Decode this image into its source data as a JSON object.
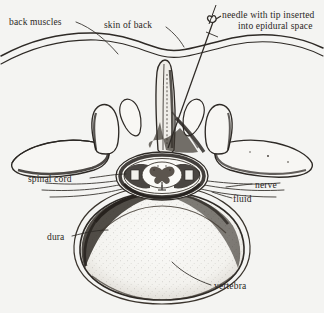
{
  "figure": {
    "type": "anatomical-line-drawing",
    "background_color": "#f4f4f2",
    "ink_color": "#2a2724",
    "labels": [
      {
        "id": "back-muscles",
        "text": "back muscles"
      },
      {
        "id": "skin-of-back",
        "text": "skin of back"
      },
      {
        "id": "needle-line1",
        "text": "needle with tip inserted"
      },
      {
        "id": "needle-line2",
        "text": "into epidural space"
      },
      {
        "id": "spinal-cord",
        "text": "spinal cord"
      },
      {
        "id": "dura",
        "text": "dura"
      },
      {
        "id": "nerve",
        "text": "nerve"
      },
      {
        "id": "fluid",
        "text": "fluid"
      },
      {
        "id": "vertebra",
        "text": "vertebra"
      }
    ],
    "structures": [
      "skin-of-back",
      "back-muscles",
      "spinous-process",
      "lamina",
      "transverse-process-left",
      "transverse-process-right",
      "spinal-canal",
      "spinal-cord",
      "dura-mater",
      "cerebrospinal-fluid",
      "nerve-roots",
      "vertebral-body",
      "epidural-needle"
    ]
  }
}
